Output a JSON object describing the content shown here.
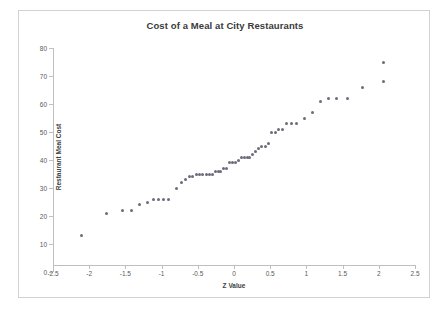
{
  "chart_data": {
    "type": "scatter",
    "title": "Cost of a Meal at City Restaurants",
    "xlabel": "Z Value",
    "ylabel": "Restaurant Meal Cost",
    "xlim": [
      -2.5,
      2.5
    ],
    "ylim": [
      0,
      80
    ],
    "xticks": [
      -2.5,
      -2,
      -1.5,
      -1,
      -0.5,
      0,
      0.5,
      1,
      1.5,
      2,
      2.5
    ],
    "xticklabels": [
      "-2.5",
      "-2",
      "-1.5",
      "-1",
      "-0.5",
      "0",
      "0.5",
      "1",
      "1.5",
      "2",
      "2.5"
    ],
    "yticks": [
      0,
      10,
      20,
      30,
      40,
      50,
      60,
      70,
      80
    ],
    "yticklabels": [
      "0",
      "10",
      "20",
      "30",
      "40",
      "50",
      "60",
      "70",
      "80"
    ],
    "grid": false,
    "legend": false,
    "marker_color": "#6b6b7a",
    "series": [
      {
        "name": "Restaurant Meal Cost",
        "x": [
          -2.11,
          -1.76,
          -1.54,
          -1.41,
          -1.31,
          -1.2,
          -1.11,
          -1.04,
          -0.97,
          -0.9,
          -0.79,
          -0.72,
          -0.67,
          -0.62,
          -0.57,
          -0.52,
          -0.47,
          -0.43,
          -0.38,
          -0.34,
          -0.3,
          -0.26,
          -0.22,
          -0.18,
          -0.14,
          -0.1,
          -0.06,
          -0.02,
          0.02,
          0.06,
          0.1,
          0.14,
          0.18,
          0.22,
          0.26,
          0.3,
          0.34,
          0.38,
          0.43,
          0.47,
          0.52,
          0.57,
          0.62,
          0.67,
          0.72,
          0.79,
          0.86,
          0.97,
          1.09,
          1.2,
          1.31,
          1.41,
          1.57,
          1.78,
          2.07
        ],
        "y": [
          13,
          21,
          22,
          22,
          24,
          25,
          26,
          26,
          26,
          26,
          30,
          32,
          33,
          34,
          34,
          35,
          35,
          35,
          35,
          35,
          35,
          36,
          36,
          36,
          37,
          37,
          39,
          39,
          39,
          40,
          41,
          41,
          41,
          41,
          42,
          43,
          44,
          45,
          45,
          46,
          50,
          50,
          51,
          51,
          53,
          53,
          53,
          55,
          57,
          61,
          62,
          62,
          62,
          66,
          68
        ]
      },
      {
        "name": "Restaurant Meal Cost (continued)",
        "x": [
          2.07
        ],
        "y": [
          75
        ]
      }
    ]
  }
}
